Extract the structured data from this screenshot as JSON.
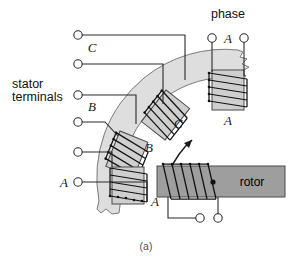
{
  "figure": {
    "caption": "(a)",
    "type": "electrical-machine-diagram",
    "title_note": "Three-phase stator with rotor winding"
  },
  "labels": {
    "phase": "phase",
    "stator_terminals_line1": "stator",
    "stator_terminals_line2": "terminals",
    "rotor": "rotor",
    "phase_a_top": "A",
    "phase_a_coil": "A",
    "phase_c_terminal": "C",
    "phase_c_coil": "C",
    "phase_b_terminal": "B",
    "phase_b_coil": "B",
    "phase_a_terminal": "A",
    "phase_a_stator_coil": "A"
  },
  "terminals": {
    "stator_count": 6,
    "rotor_count": 2,
    "phase_top_count": 2
  },
  "colors": {
    "stator_band": "#dedede",
    "coil_core": "#cfcfcf",
    "rotor_body": "#9e9e9e",
    "wire": "#2b2b2b",
    "background": "#ffffff"
  }
}
